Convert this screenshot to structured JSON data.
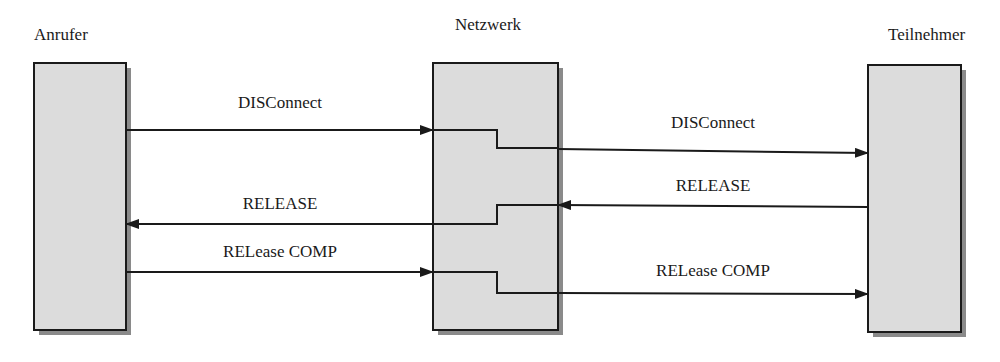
{
  "diagram": {
    "type": "sequence",
    "colors": {
      "box_fill": "#dcdcdc",
      "box_border": "#1a1a1a",
      "shadow": "#8a8a8a",
      "line": "#1a1a1a"
    },
    "participants": [
      {
        "id": "caller",
        "label": "Anrufer"
      },
      {
        "id": "network",
        "label": "Netzwerk"
      },
      {
        "id": "subscriber",
        "label": "Teilnehmer"
      }
    ],
    "messages": [
      {
        "from": "Anrufer",
        "to": "Netzwerk",
        "label": "DISConnect"
      },
      {
        "from": "Netzwerk",
        "to": "Teilnehmer",
        "label": "DISConnect"
      },
      {
        "from": "Teilnehmer",
        "to": "Netzwerk",
        "label": "RELEASE"
      },
      {
        "from": "Netzwerk",
        "to": "Anrufer",
        "label": "RELEASE"
      },
      {
        "from": "Anrufer",
        "to": "Netzwerk",
        "label": "RELease COMP"
      },
      {
        "from": "Netzwerk",
        "to": "Teilnehmer",
        "label": "RELease COMP"
      }
    ]
  }
}
